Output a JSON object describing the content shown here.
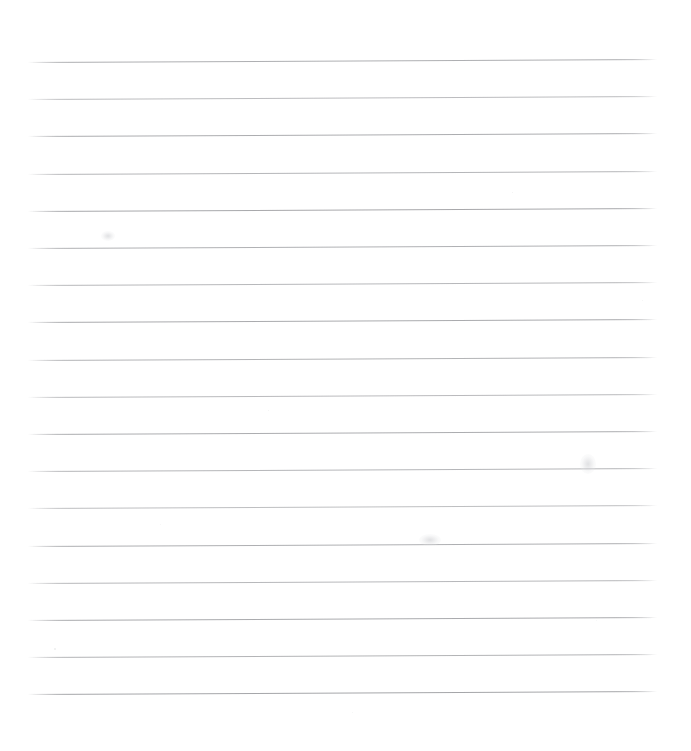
{
  "page": {
    "kind": "scanned-ruled-paper",
    "width": 691,
    "height": 751,
    "background_color": "#ffffff",
    "has_text_content": false,
    "written_content": "",
    "notes_label": "",
    "margins": {
      "left": 28,
      "right": 34,
      "top": 62,
      "bottom": 57
    }
  },
  "ruling": {
    "line_count": 18,
    "line_color": "#8f9094",
    "line_thickness_px": 1,
    "line_spacing_px": 37.2,
    "first_line_y": 62,
    "last_line_y": 694,
    "x_start": 28,
    "x_end": 657,
    "skew_degrees": -0.28,
    "has_margin_rule": false,
    "lines": [
      {
        "index": 1,
        "y_left": 62.0,
        "y_right": 59.0,
        "opacity": 0.72
      },
      {
        "index": 2,
        "y_left": 99.2,
        "y_right": 96.2,
        "opacity": 0.6
      },
      {
        "index": 3,
        "y_left": 136.4,
        "y_right": 133.4,
        "opacity": 0.74
      },
      {
        "index": 4,
        "y_left": 173.6,
        "y_right": 170.6,
        "opacity": 0.66
      },
      {
        "index": 5,
        "y_left": 210.8,
        "y_right": 207.8,
        "opacity": 0.78
      },
      {
        "index": 6,
        "y_left": 248.0,
        "y_right": 245.0,
        "opacity": 0.7
      },
      {
        "index": 7,
        "y_left": 285.2,
        "y_right": 282.2,
        "opacity": 0.64
      },
      {
        "index": 8,
        "y_left": 322.4,
        "y_right": 319.4,
        "opacity": 0.76
      },
      {
        "index": 9,
        "y_left": 359.6,
        "y_right": 356.6,
        "opacity": 0.68
      },
      {
        "index": 10,
        "y_left": 396.8,
        "y_right": 393.8,
        "opacity": 0.62
      },
      {
        "index": 11,
        "y_left": 434.0,
        "y_right": 431.0,
        "opacity": 0.74
      },
      {
        "index": 12,
        "y_left": 471.2,
        "y_right": 468.2,
        "opacity": 0.66
      },
      {
        "index": 13,
        "y_left": 508.4,
        "y_right": 505.4,
        "opacity": 0.58
      },
      {
        "index": 14,
        "y_left": 545.6,
        "y_right": 542.6,
        "opacity": 0.72
      },
      {
        "index": 15,
        "y_left": 582.8,
        "y_right": 579.8,
        "opacity": 0.64
      },
      {
        "index": 16,
        "y_left": 620.0,
        "y_right": 617.0,
        "opacity": 0.76
      },
      {
        "index": 17,
        "y_left": 657.2,
        "y_right": 654.2,
        "opacity": 0.68
      },
      {
        "index": 18,
        "y_left": 694.4,
        "y_right": 691.4,
        "opacity": 0.8
      }
    ]
  },
  "artifacts": {
    "smudges": [
      {
        "x": 588,
        "y": 464,
        "w": 16,
        "h": 20
      },
      {
        "x": 430,
        "y": 540,
        "w": 22,
        "h": 12
      },
      {
        "x": 108,
        "y": 236,
        "w": 14,
        "h": 10
      }
    ],
    "specks": [
      {
        "x": 54,
        "y": 648,
        "size": 1.5,
        "opacity": 0.35
      },
      {
        "x": 512,
        "y": 192,
        "size": 1.2,
        "opacity": 0.3
      },
      {
        "x": 268,
        "y": 410,
        "size": 1.0,
        "opacity": 0.28
      },
      {
        "x": 642,
        "y": 300,
        "size": 1.3,
        "opacity": 0.26
      },
      {
        "x": 352,
        "y": 712,
        "size": 1.1,
        "opacity": 0.22
      },
      {
        "x": 160,
        "y": 524,
        "size": 1.0,
        "opacity": 0.24
      },
      {
        "x": 596,
        "y": 620,
        "size": 1.2,
        "opacity": 0.2
      }
    ]
  }
}
